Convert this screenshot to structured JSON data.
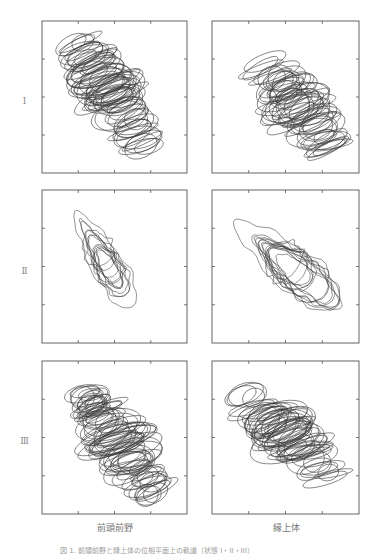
{
  "chart_data": {
    "type": "line",
    "rows": [
      {
        "label": "I"
      },
      {
        "label": "II"
      },
      {
        "label": "III"
      }
    ],
    "columns": [
      {
        "label": "前頭前野"
      },
      {
        "label": "縁上体"
      }
    ],
    "axes": {
      "xlim": [
        0,
        4
      ],
      "ylim": [
        0,
        4
      ],
      "xticks": [
        1,
        2,
        3
      ],
      "yticks": [
        1,
        2,
        3
      ],
      "tick_labels_shown": false,
      "grid": false
    },
    "panels": [
      {
        "row": "I",
        "column": "前頭前野",
        "pattern": "overlapping ellipses",
        "center": [
          1.9,
          2.1
        ],
        "spread_axis": "diagonal-down",
        "orientation_deg": -55,
        "loops": 70,
        "extent": [
          [
            0.7,
            3.4
          ],
          [
            0.4,
            3.8
          ]
        ]
      },
      {
        "row": "I",
        "column": "縁上体",
        "pattern": "overlapping ellipses",
        "center": [
          2.3,
          1.8
        ],
        "spread_axis": "diagonal-down",
        "orientation_deg": -50,
        "loops": 55,
        "extent": [
          [
            0.7,
            3.2
          ],
          [
            0.7,
            3.3
          ]
        ]
      },
      {
        "row": "II",
        "column": "前頭前野",
        "pattern": "irregular closed blobs",
        "center": [
          1.7,
          2.2
        ],
        "spread_axis": "diagonal-down",
        "orientation_deg": -58,
        "loops": 12,
        "extent": [
          [
            0.9,
            2.9
          ],
          [
            0.4,
            3.4
          ]
        ]
      },
      {
        "row": "II",
        "column": "縁上体",
        "pattern": "irregular closed blobs",
        "center": [
          2.0,
          2.1
        ],
        "spread_axis": "diagonal-down",
        "orientation_deg": -38,
        "loops": 14,
        "extent": [
          [
            0.3,
            3.7
          ],
          [
            0.7,
            3.4
          ]
        ]
      },
      {
        "row": "III",
        "column": "前頭前野",
        "pattern": "overlapping ellipses",
        "center": [
          2.1,
          1.9
        ],
        "spread_axis": "diagonal-down",
        "orientation_deg": -55,
        "loops": 75,
        "extent": [
          [
            0.6,
            3.1
          ],
          [
            0.3,
            3.6
          ]
        ]
      },
      {
        "row": "III",
        "column": "縁上体",
        "pattern": "overlapping ellipses",
        "center": [
          2.0,
          2.1
        ],
        "spread_axis": "diagonal-down",
        "orientation_deg": -42,
        "loops": 60,
        "extent": [
          [
            0.3,
            3.3
          ],
          [
            0.5,
            3.4
          ]
        ]
      }
    ],
    "title": "",
    "xlabel": "",
    "ylabel": ""
  },
  "figure": {
    "row_labels": [
      "I",
      "II",
      "III"
    ],
    "column_labels": [
      "前頭前野",
      "縁上体"
    ],
    "caption": "図 1.  前頭前野と縁上体の位相平面上の軌道（状態 I・II・III）",
    "line_color": "#3a3a3a",
    "frame_color": "#555555"
  }
}
